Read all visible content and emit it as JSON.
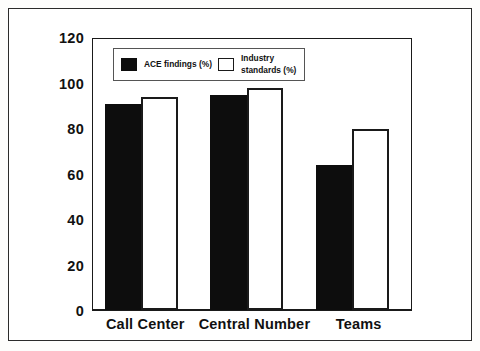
{
  "chart_data": {
    "type": "bar",
    "title": "",
    "xlabel": "",
    "ylabel": "",
    "categories": [
      "Call Center",
      "Central Number",
      "Teams"
    ],
    "series": [
      {
        "name": "ACE findings (%)",
        "style": "filled",
        "color": "#0d0d0d",
        "values": [
          91,
          95,
          64
        ]
      },
      {
        "name": "Industry standards (%)",
        "style": "hollow",
        "color": "#ffffff",
        "values": [
          94,
          98,
          80
        ]
      }
    ],
    "ylim": [
      0,
      120
    ],
    "yticks": [
      0,
      20,
      40,
      60,
      80,
      100,
      120
    ],
    "ytick_labels": [
      "0",
      "20",
      "40",
      "60",
      "80",
      "100",
      "120"
    ],
    "grid": false,
    "legend_position": "upper left",
    "legend": {
      "entries": [
        {
          "label": "ACE findings (%)",
          "swatch": "filled"
        },
        {
          "label": "Industry\nstandards (%)",
          "swatch": "hollow"
        }
      ]
    }
  },
  "figure": {
    "frame_color": "#2b2b2b",
    "axis_color": "#1a1a1a",
    "background": "#ffffff"
  }
}
